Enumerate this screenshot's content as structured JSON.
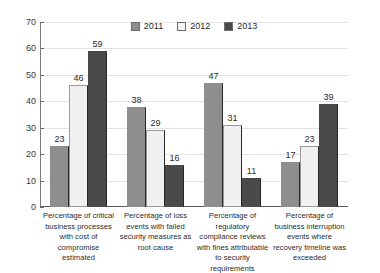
{
  "chart_data": {
    "type": "bar",
    "title": "",
    "subtitle": "",
    "xlabel": "",
    "ylabel": "",
    "ylim": [
      0,
      70
    ],
    "yticks": [
      0,
      10,
      20,
      30,
      40,
      50,
      60,
      70
    ],
    "grid": true,
    "legend_position": "top-center",
    "categories": [
      "Percentage of critical business processes with cost of compromise estimated",
      "Percentage of loss events with failed security measures as root cause",
      "Percentage of regulatory compliance reviews with fines attributable to security requirements",
      "Percentage of business interruption events where recovery timeline was exceeded"
    ],
    "series": [
      {
        "name": "2011",
        "color": "#8e8e8e",
        "values": [
          23,
          38,
          47,
          17
        ]
      },
      {
        "name": "2012",
        "color": "#f0f0f0",
        "values": [
          46,
          29,
          31,
          23
        ]
      },
      {
        "name": "2013",
        "color": "#4a4a4a",
        "values": [
          59,
          16,
          11,
          39
        ]
      }
    ]
  },
  "axis": {
    "y_tick_labels": [
      "70",
      "60",
      "50",
      "40",
      "30",
      "20",
      "10",
      "0"
    ]
  },
  "legend": {
    "items": [
      {
        "label": "2011"
      },
      {
        "label": "2012"
      },
      {
        "label": "2013"
      }
    ]
  },
  "x_labels": [
    "Percentage of critical business processes with cost of compromise estimated",
    "Percentage of loss events with failed security measures as root cause",
    "Percentage of regulatory compliance reviews with fines attributable to security requirements",
    "Percentage of business interruption events where recovery timeline was exceeded"
  ],
  "colors": {
    "series_2011": "#8e8e8e",
    "series_2012": "#f0f0f0",
    "series_2013": "#4a4a4a",
    "gridline": "#e2e2e2",
    "axis": "#5a5a5a",
    "text": "#2b2b2b",
    "background": "#ffffff"
  }
}
